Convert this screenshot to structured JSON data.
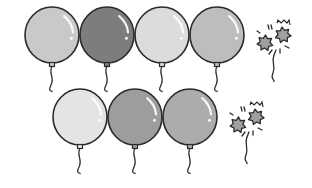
{
  "figure": {
    "stroke_color": "#2b2b2b",
    "rows": [
      {
        "name": "top-row",
        "balloons": [
          {
            "cx": 52,
            "cy": 35,
            "r": 27,
            "fill": "#c9c9c9"
          },
          {
            "cx": 107,
            "cy": 35,
            "r": 27,
            "fill": "#7d7d7d"
          },
          {
            "cx": 162,
            "cy": 35,
            "r": 27,
            "fill": "#dcdcdc"
          },
          {
            "cx": 217,
            "cy": 35,
            "r": 27,
            "fill": "#bdbdbd"
          }
        ],
        "popped": {
          "x": 275,
          "y": 42,
          "fill": "#a0a0a0"
        },
        "intact_count": 4,
        "popped_count": 1
      },
      {
        "name": "bottom-row",
        "balloons": [
          {
            "cx": 80,
            "cy": 117,
            "r": 27,
            "fill": "#e4e4e4"
          },
          {
            "cx": 135,
            "cy": 117,
            "r": 27,
            "fill": "#9d9d9d"
          },
          {
            "cx": 190,
            "cy": 117,
            "r": 27,
            "fill": "#acacac"
          }
        ],
        "popped": {
          "x": 248,
          "y": 124,
          "fill": "#a0a0a0"
        },
        "intact_count": 3,
        "popped_count": 1
      }
    ]
  }
}
